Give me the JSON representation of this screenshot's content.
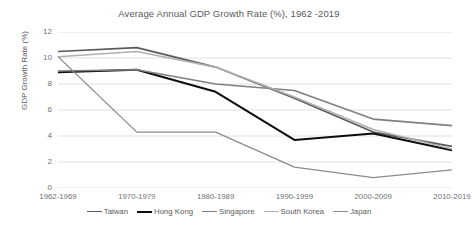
{
  "chart_data": {
    "type": "line",
    "title": "Average Annual GDP Growth Rate (%), 1962 -2019",
    "xlabel": "",
    "ylabel": "GDP Growth Rate (%)",
    "ylim": [
      0,
      12
    ],
    "yticks": [
      0,
      2,
      4,
      6,
      8,
      10,
      12
    ],
    "grid": true,
    "legend_position": "bottom",
    "categories": [
      "1962-1969",
      "1970-1979",
      "1980-1989",
      "1990-1999",
      "2000-2009",
      "2010-2019"
    ],
    "series": [
      {
        "name": "Taiwan",
        "color": "#595959",
        "width": 1.6,
        "values": [
          10.5,
          10.8,
          9.3,
          6.9,
          4.3,
          3.2
        ]
      },
      {
        "name": "Hong Kong",
        "color": "#0d0d0d",
        "width": 2.0,
        "values": [
          8.9,
          9.1,
          7.4,
          3.7,
          4.2,
          2.9
        ]
      },
      {
        "name": "Singapore",
        "color": "#7f7f7f",
        "width": 1.6,
        "values": [
          9.0,
          9.1,
          8.0,
          7.5,
          5.3,
          4.8
        ]
      },
      {
        "name": "South Korea",
        "color": "#b0b0b0",
        "width": 1.6,
        "values": [
          10.1,
          10.5,
          9.3,
          7.0,
          4.5,
          3.0
        ]
      },
      {
        "name": "Japan",
        "color": "#8c8c8c",
        "width": 1.3,
        "values": [
          10.1,
          4.3,
          4.3,
          1.6,
          0.8,
          1.4
        ]
      }
    ]
  },
  "axis": {
    "gridline_color": "#d9d9d9",
    "tick_text_color": "#707070"
  }
}
